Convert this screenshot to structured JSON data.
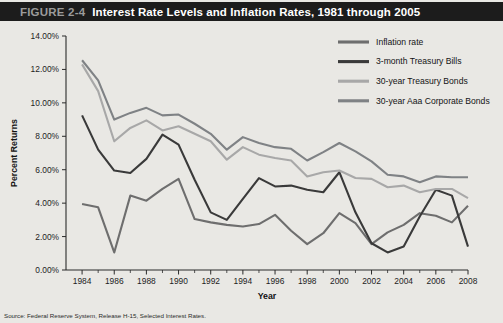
{
  "figure": {
    "number_label": "FIGURE 2-4",
    "title": "Interest Rate Levels and Inflation Rates, 1981 through 2005",
    "source_note": "Source: Federal Reserve System, Release H-15, Selected Interest Rates."
  },
  "colors": {
    "titlebar_bg": "#1c1c1c",
    "figure_number": "#9b9b9b",
    "title_text": "#ffffff",
    "panel_bg": "#e9e8e4",
    "axis": "#2b2b2b",
    "inflation_rate": "#6e6e6e",
    "treasury_bills_3m": "#3a3a3a",
    "treasury_bonds_30y": "#a8a8a8",
    "corporate_bonds_aaa_30y": "#7f8285"
  },
  "chart_data": {
    "type": "line",
    "title": "Interest Rate Levels and Inflation Rates, 1981 through 2005",
    "xlabel": "Year",
    "ylabel": "Percent Returns",
    "grid": false,
    "legend_position": "top-right",
    "xlim": [
      1983,
      2008
    ],
    "ylim": [
      0,
      14
    ],
    "ytick_labels": [
      "0.00%",
      "2.00%",
      "4.00%",
      "6.00%",
      "8.00%",
      "10.00%",
      "12.00%",
      "14.00%"
    ],
    "ytick_values": [
      0,
      2,
      4,
      6,
      8,
      10,
      12,
      14
    ],
    "xtick_labels": [
      "1984",
      "1986",
      "1988",
      "1990",
      "1992",
      "1994",
      "1996",
      "1998",
      "2000",
      "2002",
      "2004",
      "2006",
      "2008"
    ],
    "xtick_values": [
      1984,
      1986,
      1988,
      1990,
      1992,
      1994,
      1996,
      1998,
      2000,
      2002,
      2004,
      2006,
      2008
    ],
    "x": [
      1984,
      1985,
      1986,
      1987,
      1988,
      1989,
      1990,
      1991,
      1992,
      1993,
      1994,
      1995,
      1996,
      1997,
      1998,
      1999,
      2000,
      2001,
      2002,
      2003,
      2004,
      2005,
      2006,
      2007,
      2008
    ],
    "series": [
      {
        "name": "Inflation rate",
        "color": "#6e6e6e",
        "values": [
          3.95,
          3.75,
          1.05,
          4.45,
          4.15,
          4.85,
          5.45,
          3.05,
          2.85,
          2.7,
          2.6,
          2.75,
          3.3,
          2.35,
          1.55,
          2.2,
          3.4,
          2.8,
          1.55,
          2.25,
          2.7,
          3.4,
          3.25,
          2.85,
          3.85
        ]
      },
      {
        "name": "3-month Treasury Bills",
        "color": "#3a3a3a",
        "values": [
          9.25,
          7.2,
          5.95,
          5.8,
          6.65,
          8.1,
          7.5,
          5.4,
          3.45,
          3.0,
          4.25,
          5.5,
          5.0,
          5.05,
          4.8,
          4.65,
          5.85,
          3.45,
          1.6,
          1.05,
          1.4,
          3.2,
          4.8,
          4.45,
          1.4
        ]
      },
      {
        "name": "30-year Treasury Bonds",
        "color": "#a8a8a8",
        "values": [
          12.3,
          10.7,
          7.7,
          8.5,
          8.95,
          8.35,
          8.6,
          8.15,
          7.7,
          6.6,
          7.35,
          6.9,
          6.7,
          6.55,
          5.6,
          5.85,
          5.95,
          5.5,
          5.45,
          4.95,
          5.05,
          4.65,
          4.85,
          4.85,
          4.3
        ]
      },
      {
        "name": "30-year Aaa Corporate Bonds",
        "color": "#7f8285",
        "values": [
          12.55,
          11.35,
          9.0,
          9.4,
          9.7,
          9.25,
          9.3,
          8.75,
          8.15,
          7.2,
          7.95,
          7.6,
          7.35,
          7.25,
          6.55,
          7.05,
          7.6,
          7.1,
          6.5,
          5.7,
          5.6,
          5.25,
          5.6,
          5.55,
          5.55
        ]
      }
    ]
  },
  "legend": {
    "items": [
      {
        "label": "Inflation rate",
        "color": "#6e6e6e"
      },
      {
        "label": "3-month Treasury Bills",
        "color": "#3a3a3a"
      },
      {
        "label": "30-year Treasury Bonds",
        "color": "#a8a8a8"
      },
      {
        "label": "30-year Aaa Corporate Bonds",
        "color": "#7f8285"
      }
    ]
  }
}
